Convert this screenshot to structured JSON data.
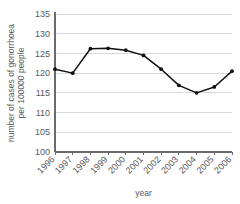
{
  "chart_data": {
    "type": "line",
    "title": "",
    "xlabel": "year",
    "ylabel": "number of cases of gonorrhoea per 100000 people",
    "ylabel_lines": [
      "number of cases of gonorrhoea",
      "per 100000 people"
    ],
    "categories": [
      "1996",
      "1997",
      "1998",
      "1999",
      "2000",
      "2001",
      "2002",
      "2003",
      "2004",
      "2005",
      "2006"
    ],
    "values": [
      121,
      120,
      126.2,
      126.3,
      125.8,
      124.5,
      121,
      116.9,
      115,
      116.5,
      120.5
    ],
    "series": [
      {
        "name": "gonorrhoea cases per 100000 people",
        "values": [
          121,
          120,
          126.2,
          126.3,
          125.8,
          124.5,
          121,
          116.9,
          115,
          116.5,
          120.5
        ]
      }
    ],
    "ylim": [
      100,
      135
    ],
    "yticks": [
      100,
      105,
      110,
      115,
      120,
      125,
      130,
      135
    ],
    "ytick_labels": [
      "100",
      "105",
      "110",
      "115",
      "120",
      "125",
      "130",
      "135"
    ],
    "xtick_labels": [
      "1996",
      "1997",
      "1998",
      "1999",
      "2000",
      "2001",
      "2002",
      "2003",
      "2004",
      "2005",
      "2006"
    ],
    "xtick_rotation": -45,
    "grid": "horizontal",
    "legend": "none",
    "marker": "circle",
    "colors": {
      "series": "#111111",
      "grid": "#d9d9d9",
      "axis": "#6b6b6d",
      "text": "#59595b",
      "background": "#ffffff"
    }
  }
}
